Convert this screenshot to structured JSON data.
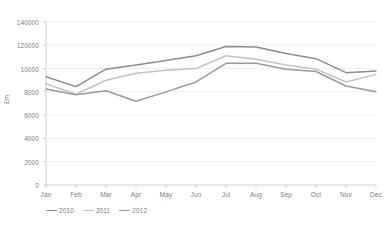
{
  "chart_data": {
    "type": "line",
    "title": "",
    "xlabel": "",
    "ylabel": "£m",
    "ylim": [
      0,
      140000
    ],
    "grid": true,
    "legend_position": "bottom-left",
    "categories": [
      "Jan",
      "Feb",
      "Mar",
      "Apr",
      "May",
      "Jun",
      "Jul",
      "Aug",
      "Sep",
      "Oct",
      "Nov",
      "Dec"
    ],
    "y_tick_labels": [
      "140000",
      "120000",
      "10000",
      "8000",
      "6000",
      "4000",
      "2000",
      "0"
    ],
    "y_tick_values": [
      140000,
      120000,
      100000,
      80000,
      60000,
      40000,
      20000,
      0
    ],
    "series": [
      {
        "name": "2010",
        "color": "#8c8c8c",
        "values": [
          93000,
          84500,
          99500,
          103000,
          107000,
          111000,
          119000,
          118500,
          113000,
          108500,
          96500,
          98000
        ]
      },
      {
        "name": "2011",
        "color": "#c2c2c2",
        "values": [
          87000,
          78000,
          90000,
          96000,
          98500,
          100000,
          111000,
          108000,
          103000,
          99500,
          88500,
          95000
        ]
      },
      {
        "name": "2012",
        "color": "#9a9a9a",
        "values": [
          82500,
          77500,
          81000,
          72000,
          80000,
          88500,
          104500,
          104500,
          99500,
          97500,
          85000,
          80000
        ]
      }
    ]
  },
  "legend": {
    "items": [
      {
        "label": "2010"
      },
      {
        "label": "2011"
      },
      {
        "label": "2012"
      }
    ]
  },
  "axes": {
    "y_title": "£m"
  },
  "colors": {
    "gridline": "#e9e9e9",
    "axis": "#c4c4c4",
    "text": "#7d7d7d",
    "background": "#ffffff"
  }
}
